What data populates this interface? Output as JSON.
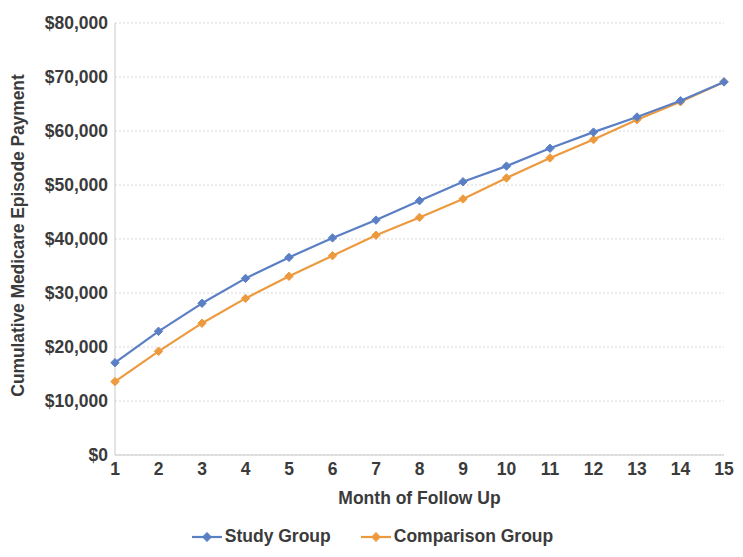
{
  "chart_data": {
    "type": "line",
    "title": "",
    "xlabel": "Month of Follow Up",
    "ylabel": "Cumulative Medicare Episode Payment",
    "x": [
      1,
      2,
      3,
      4,
      5,
      6,
      7,
      8,
      9,
      10,
      11,
      12,
      13,
      14,
      15
    ],
    "x_tick_labels": [
      "1",
      "2",
      "3",
      "4",
      "5",
      "6",
      "7",
      "8",
      "9",
      "10",
      "11",
      "12",
      "13",
      "14",
      "15"
    ],
    "y_tick_labels": [
      "$0",
      "$10,000",
      "$20,000",
      "$30,000",
      "$40,000",
      "$50,000",
      "$60,000",
      "$70,000",
      "$80,000"
    ],
    "y_tick_values": [
      0,
      10000,
      20000,
      30000,
      40000,
      50000,
      60000,
      70000,
      80000
    ],
    "xlim": [
      1,
      15
    ],
    "ylim": [
      0,
      80000
    ],
    "grid": "horizontal",
    "legend_position": "bottom",
    "series": [
      {
        "name": "Study Group",
        "color": "#5B7FC4",
        "values": [
          17100,
          22900,
          28100,
          32700,
          36600,
          40200,
          43500,
          47100,
          50600,
          53500,
          56800,
          59800,
          62600,
          65600,
          69100
        ]
      },
      {
        "name": "Comparison Group",
        "color": "#ED9A3E",
        "values": [
          13600,
          19200,
          24400,
          29000,
          33100,
          36900,
          40700,
          44000,
          47400,
          51300,
          55000,
          58400,
          62100,
          65400,
          69100
        ]
      }
    ]
  },
  "legend": {
    "items": [
      {
        "label": "Study Group",
        "color": "#5B7FC4",
        "marker": "diamond-line-marker"
      },
      {
        "label": "Comparison Group",
        "color": "#ED9A3E",
        "marker": "diamond-line-marker"
      }
    ]
  }
}
